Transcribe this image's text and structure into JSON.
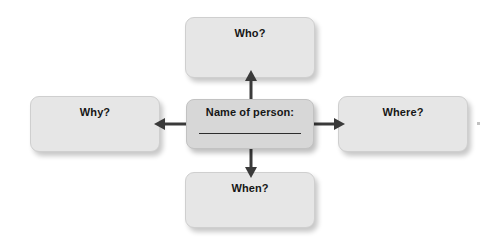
{
  "page": {
    "background_color": "#ffffff"
  },
  "colors": {
    "box_fill": "#e6e6e6",
    "center_box_fill": "#d7d7d7",
    "box_border": "#cfcfcf",
    "text": "#161616",
    "arrow": "#3a3a3a",
    "write_line": "#2d2d2d"
  },
  "center": {
    "label": "Name of person:",
    "has_write_line": true
  },
  "nodes": [
    {
      "id": "who",
      "label": "Who?",
      "position": "top"
    },
    {
      "id": "why",
      "label": "Why?",
      "position": "left"
    },
    {
      "id": "where",
      "label": "Where?",
      "position": "right"
    },
    {
      "id": "when",
      "label": "When?",
      "position": "bottom"
    }
  ],
  "arrows": [
    {
      "id": "up",
      "from": "center",
      "to": "who",
      "direction": "up"
    },
    {
      "id": "left",
      "from": "center",
      "to": "why",
      "direction": "left"
    },
    {
      "id": "right",
      "from": "center",
      "to": "where",
      "direction": "right"
    },
    {
      "id": "down",
      "from": "center",
      "to": "when",
      "direction": "down"
    }
  ]
}
